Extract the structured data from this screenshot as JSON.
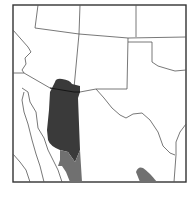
{
  "map": {
    "type": "species-range-map",
    "region": "Southwestern United States and northwestern Mexico",
    "colors": {
      "background": "#ffffff",
      "frame": "#333333",
      "borders": "#555555",
      "range_primary": "#3a3a3a",
      "range_secondary": "#707070"
    },
    "legend": []
  }
}
